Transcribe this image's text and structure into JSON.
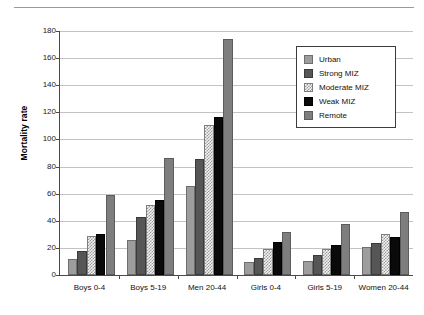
{
  "chart_data": {
    "type": "bar",
    "title": "",
    "xlabel": "",
    "ylabel": "Mortality rate",
    "ylim": [
      0,
      180
    ],
    "yticks": [
      0,
      20,
      40,
      60,
      80,
      100,
      120,
      140,
      160,
      180
    ],
    "ytick_labels": [
      "0",
      "20",
      "40",
      "60",
      "80",
      "100",
      "120",
      "140",
      "160",
      "180"
    ],
    "grid": true,
    "legend_position": "upper right",
    "categories": [
      "Boys 0-4",
      "Boys 5-19",
      "Men 20-44",
      "Girls 0-4",
      "Girls 5-19",
      "Women 20-44"
    ],
    "series": [
      {
        "name": "Urban",
        "color": "#9d9d9d",
        "values": [
          12,
          25.5,
          66,
          9.5,
          10.5,
          20.5
        ]
      },
      {
        "name": "Strong MIZ",
        "color": "#565656",
        "values": [
          17.5,
          43,
          85.5,
          12.5,
          14.5,
          23.5
        ]
      },
      {
        "name": "Moderate MIZ",
        "color": "#f2f2f2",
        "values": [
          28.5,
          51.5,
          111,
          19,
          19,
          30.5
        ]
      },
      {
        "name": "Weak MIZ",
        "color": "#0a0a0a",
        "values": [
          30.5,
          55.5,
          116.5,
          24.5,
          22.5,
          28
        ]
      },
      {
        "name": "Remote",
        "color": "#7e7e7e",
        "values": [
          59,
          86,
          174,
          32,
          38,
          46.5
        ]
      }
    ]
  },
  "axes": {
    "y_title": "Mortality rate"
  },
  "legend": {
    "entries": [
      {
        "label": "Urban"
      },
      {
        "label": "Strong MIZ"
      },
      {
        "label": "Moderate MIZ"
      },
      {
        "label": "Weak MIZ"
      },
      {
        "label": "Remote"
      }
    ]
  }
}
